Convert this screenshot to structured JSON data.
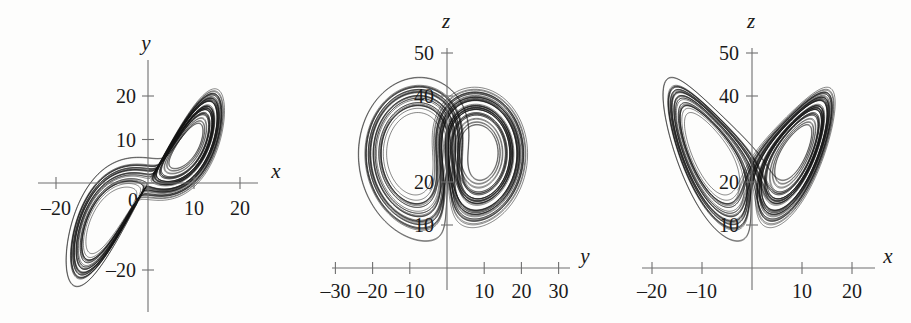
{
  "figure": {
    "width": 911,
    "height": 323,
    "background": "#fdfdfc",
    "ink": "#111111",
    "axis_color": "#6f6f6f"
  },
  "chart_data": [
    {
      "type": "line",
      "name": "lorenz-xy-projection",
      "title": "",
      "xlabel": "x",
      "ylabel": "y",
      "xticks": [
        -20,
        10,
        20
      ],
      "xtick_labels": [
        "–20",
        "10",
        "20"
      ],
      "yticks": [
        20,
        10,
        0,
        -20
      ],
      "ytick_labels": [
        "20",
        "10",
        "0",
        "–20"
      ],
      "xlim": [
        -28,
        28
      ],
      "ylim": [
        -32,
        32
      ],
      "grid": false,
      "legend": "none",
      "annotation": "Lorenz attractor projected onto the x–y plane; two lobes centered near (–10,–10) and (10,10)",
      "lorenz_params": {
        "sigma": 10,
        "rho": 28,
        "beta": 2.6666667
      },
      "projection": {
        "horizontal": "x",
        "vertical": "y"
      }
    },
    {
      "type": "line",
      "name": "lorenz-yz-projection",
      "title": "",
      "xlabel": "y",
      "ylabel": "z",
      "xticks": [
        -30,
        -20,
        -10,
        10,
        20,
        30
      ],
      "xtick_labels": [
        "–30",
        "–20",
        "–10",
        "10",
        "20",
        "30"
      ],
      "yticks": [
        50,
        40,
        20,
        10
      ],
      "ytick_labels": [
        "50",
        "40",
        "20",
        "10"
      ],
      "xlim": [
        -35,
        35
      ],
      "ylim": [
        0,
        56
      ],
      "grid": false,
      "legend": "none",
      "annotation": "Lorenz attractor projected onto the y–z plane; two overlapping rings",
      "lorenz_params": {
        "sigma": 10,
        "rho": 28,
        "beta": 2.6666667
      },
      "projection": {
        "horizontal": "y",
        "vertical": "z"
      }
    },
    {
      "type": "line",
      "name": "lorenz-xz-projection",
      "title": "",
      "xlabel": "x",
      "ylabel": "z",
      "xticks": [
        -20,
        -10,
        10,
        20
      ],
      "xtick_labels": [
        "–20",
        "–10",
        "10",
        "20"
      ],
      "yticks": [
        50,
        40,
        20,
        10
      ],
      "ytick_labels": [
        "50",
        "40",
        "20",
        "10"
      ],
      "xlim": [
        -26,
        26
      ],
      "ylim": [
        0,
        56
      ],
      "grid": false,
      "legend": "none",
      "annotation": "Lorenz attractor projected onto the x–z plane; classic butterfly shape",
      "lorenz_params": {
        "sigma": 10,
        "rho": 28,
        "beta": 2.6666667
      },
      "projection": {
        "horizontal": "x",
        "vertical": "z"
      }
    }
  ],
  "panels": [
    {
      "id": "panel-xy",
      "left": 0,
      "width": 300,
      "origin_x": 148,
      "origin_y": 183,
      "scale_x": 4.6,
      "scale_y": 4.35,
      "x_axis_label": "x",
      "y_axis_label": "y",
      "x_label_pos": {
        "x": 276,
        "y": 178
      },
      "y_label_pos": {
        "x": 146,
        "y": 50
      },
      "axis_h_span": [
        38,
        258
      ],
      "axis_v_span": [
        60,
        312
      ],
      "xticks": [
        {
          "value": -20,
          "label": "–20",
          "label_dx": 0,
          "label_dy": 32
        },
        {
          "value": 10,
          "label": "10",
          "label_dx": 0,
          "label_dy": 32
        },
        {
          "value": 20,
          "label": "20",
          "label_dx": 0,
          "label_dy": 32
        }
      ],
      "yticks": [
        {
          "value": 20,
          "label": "20",
          "label_dx": -12,
          "label_dy": 7
        },
        {
          "value": 10,
          "label": "10",
          "label_dx": -12,
          "label_dy": 7
        },
        {
          "value": 0,
          "label": "0",
          "label_dx": -10,
          "label_dy": 24
        },
        {
          "value": -20,
          "label": "–20",
          "label_dx": -12,
          "label_dy": 7
        }
      ]
    },
    {
      "id": "panel-yz",
      "left": 300,
      "width": 300,
      "origin_x": 147,
      "origin_y": 268,
      "scale_x": 3.72,
      "scale_y": 4.3,
      "x_axis_label": "y",
      "y_axis_label": "z",
      "x_label_pos": {
        "x": 285,
        "y": 263
      },
      "y_label_pos": {
        "x": 146,
        "y": 28
      },
      "axis_h_span": [
        32,
        270
      ],
      "axis_v_span": [
        48,
        290
      ],
      "xticks": [
        {
          "value": -30,
          "label": "–30",
          "label_dx": 0,
          "label_dy": 30
        },
        {
          "value": -20,
          "label": "–20",
          "label_dx": 0,
          "label_dy": 30
        },
        {
          "value": -10,
          "label": "–10",
          "label_dx": 0,
          "label_dy": 30
        },
        {
          "value": 10,
          "label": "10",
          "label_dx": 0,
          "label_dy": 30
        },
        {
          "value": 20,
          "label": "20",
          "label_dx": 0,
          "label_dy": 30
        },
        {
          "value": 30,
          "label": "30",
          "label_dx": 0,
          "label_dy": 30
        }
      ],
      "yticks": [
        {
          "value": 50,
          "label": "50",
          "label_dx": -13,
          "label_dy": 7
        },
        {
          "value": 40,
          "label": "40",
          "label_dx": -13,
          "label_dy": 7
        },
        {
          "value": 20,
          "label": "20",
          "label_dx": -13,
          "label_dy": 7
        },
        {
          "value": 10,
          "label": "10",
          "label_dx": -13,
          "label_dy": 7
        }
      ]
    },
    {
      "id": "panel-xz",
      "left": 600,
      "width": 311,
      "origin_x": 152,
      "origin_y": 268,
      "scale_x": 5.0,
      "scale_y": 4.3,
      "x_axis_label": "x",
      "y_axis_label": "z",
      "x_label_pos": {
        "x": 288,
        "y": 263
      },
      "y_label_pos": {
        "x": 151,
        "y": 28
      },
      "axis_h_span": [
        42,
        275
      ],
      "axis_v_span": [
        48,
        290
      ],
      "xticks": [
        {
          "value": -20,
          "label": "–20",
          "label_dx": 0,
          "label_dy": 30
        },
        {
          "value": -10,
          "label": "–10",
          "label_dx": 0,
          "label_dy": 30
        },
        {
          "value": 10,
          "label": "10",
          "label_dx": 0,
          "label_dy": 30
        },
        {
          "value": 20,
          "label": "20",
          "label_dx": 0,
          "label_dy": 30
        }
      ],
      "yticks": [
        {
          "value": 50,
          "label": "50",
          "label_dx": -13,
          "label_dy": 7
        },
        {
          "value": 40,
          "label": "40",
          "label_dx": -13,
          "label_dy": 7
        },
        {
          "value": 20,
          "label": "20",
          "label_dx": -13,
          "label_dy": 7
        },
        {
          "value": 10,
          "label": "10",
          "label_dx": -13,
          "label_dy": 7
        }
      ]
    }
  ]
}
